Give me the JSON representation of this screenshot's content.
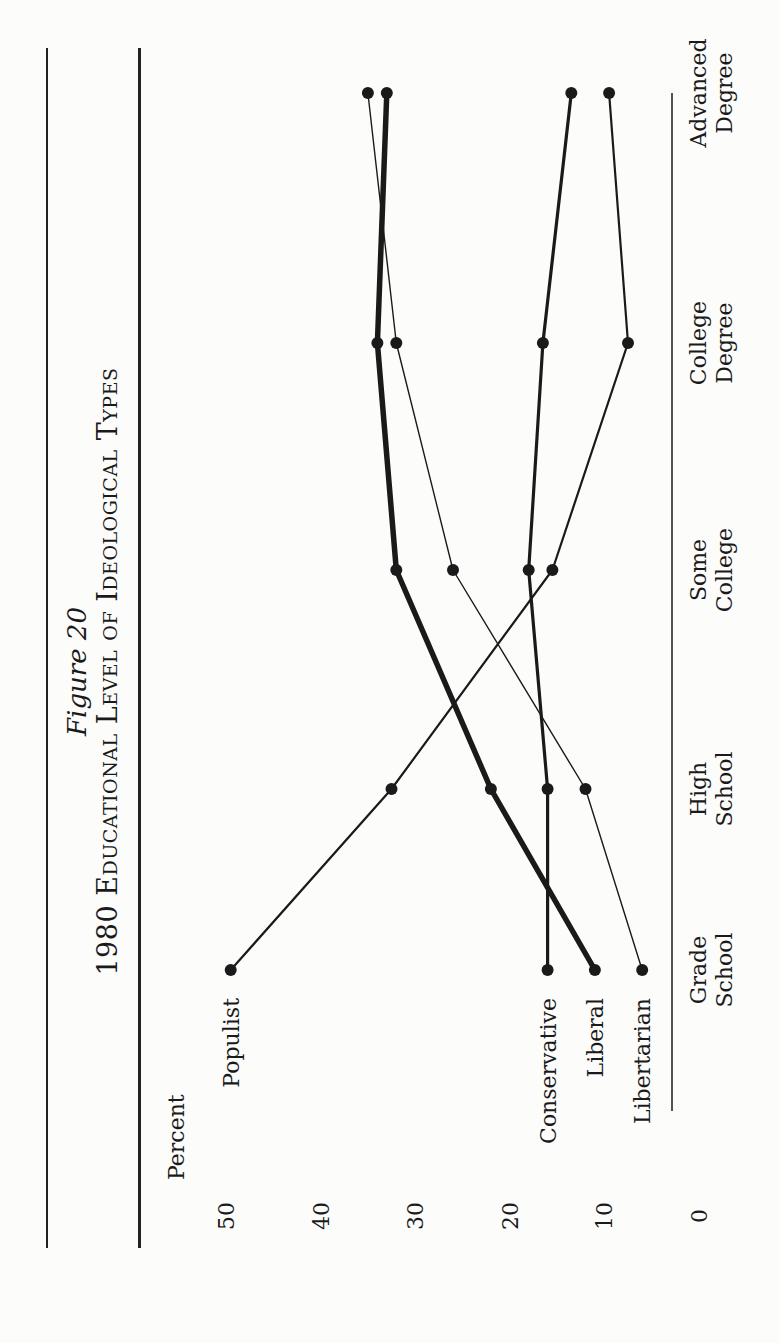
{
  "figure": {
    "label": "Figure 20",
    "title": "1980 Educational Level of Ideological Types"
  },
  "axis": {
    "ylabel": "Percent",
    "ticks": [
      "50",
      "40",
      "30",
      "20",
      "10",
      "0"
    ]
  },
  "categories": [
    "Grade School",
    "High School",
    "Some College",
    "College Degree",
    "Advanced Degree"
  ],
  "category_lines": [
    [
      "Grade",
      "School"
    ],
    [
      "High",
      "School"
    ],
    [
      "Some",
      "College"
    ],
    [
      "College",
      "Degree"
    ],
    [
      "Advanced",
      "Degree"
    ]
  ],
  "series_labels": {
    "populist": "Populist",
    "conservative": "Conservative",
    "liberal": "Liberal",
    "libertarian": "Libertarian"
  },
  "colors": {
    "ink": "#1a1a1a",
    "paper": "#fcfcfb"
  },
  "chart_data": {
    "type": "line",
    "title": "1980 Educational Level of Ideological Types",
    "subtitle": "Figure 20",
    "xlabel": "",
    "ylabel": "Percent",
    "ylim": [
      0,
      50
    ],
    "yticks": [
      0,
      10,
      20,
      30,
      40,
      50
    ],
    "grid": false,
    "legend": "direct labels at Grade School end of each line",
    "categories": [
      "Grade School",
      "High School",
      "Some College",
      "College Degree",
      "Advanced Degree"
    ],
    "series": [
      {
        "name": "Populist",
        "values": [
          49.5,
          32.5,
          15.5,
          7.5,
          9.5
        ],
        "line_weight": "medium"
      },
      {
        "name": "Conservative",
        "values": [
          16,
          16,
          18,
          16.5,
          13.5
        ],
        "line_weight": "heavy"
      },
      {
        "name": "Liberal",
        "values": [
          11,
          22,
          32,
          34,
          33
        ],
        "line_weight": "heaviest"
      },
      {
        "name": "Libertarian",
        "values": [
          6,
          12,
          26,
          32,
          35
        ],
        "line_weight": "thin"
      }
    ],
    "orientation_note": "page printed rotated 90 degrees counter-clockwise"
  }
}
